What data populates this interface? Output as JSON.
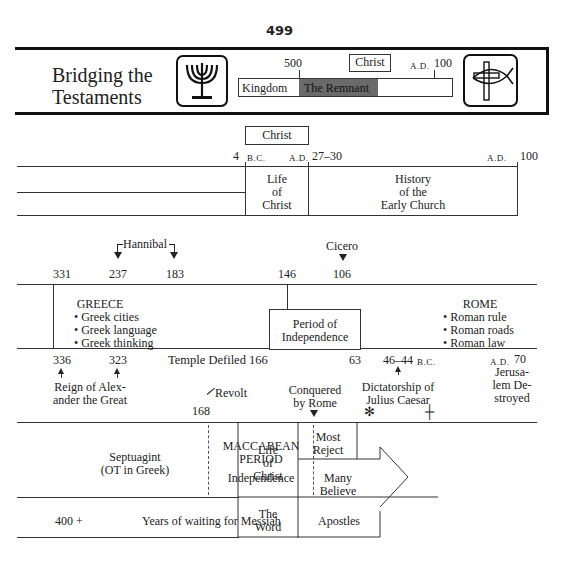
{
  "page_number": "499",
  "header": {
    "title_line1": "Bridging the",
    "title_line2": "Testaments",
    "mini_timeline": {
      "tick_500": "500",
      "christ_label": "Christ",
      "ad_prefix": "A.D.",
      "ad_100": "100",
      "kingdom": "Kingdom",
      "remnant": "The Remnant"
    },
    "left_icon": "menorah-icon",
    "right_icon": "cross-fish-icon"
  },
  "section1": {
    "christ_label": "Christ",
    "date_4bc_num": "4",
    "date_4bc_suffix": "B.C.",
    "date_ad_prefix": "A.D.",
    "date_27_30": "27–30",
    "date_ad100_prefix": "A.D.",
    "date_ad100": "100",
    "life_of_christ": [
      "Life",
      "of",
      "Christ"
    ],
    "early_church": [
      "History",
      "of the",
      "Early Church"
    ]
  },
  "section2": {
    "hannibal": "Hannibal",
    "cicero": "Cicero",
    "top_dates": [
      "331",
      "237",
      "183",
      "146",
      "106"
    ],
    "greece": {
      "title": "GREECE",
      "items": [
        "Greek cities",
        "Greek language",
        "Greek thinking"
      ]
    },
    "independence_box": [
      "Period of",
      "Independence"
    ],
    "rome": {
      "title": "ROME",
      "items": [
        "Roman rule",
        "Roman roads",
        "Roman law"
      ]
    },
    "bottom_dates": {
      "d336": "336",
      "d323": "323",
      "temple": "Temple Defiled 166",
      "d63": "63",
      "d46_44": "46–44",
      "bc": "B.C.",
      "ad": "A.D.",
      "d70": "70"
    },
    "alexander": [
      "Reign of Alex-",
      "ander the Great"
    ],
    "revolt": "Revolt",
    "d168": "168",
    "conquered": [
      "Conquered",
      "by Rome"
    ],
    "caesar": [
      "Dictatorship of",
      "Julius Caesar"
    ],
    "jerusalem": [
      "Jerusa-",
      "lem De-",
      "stroyed"
    ]
  },
  "section3": {
    "septuagint": [
      "Septuagint",
      "(OT in Greek)"
    ],
    "maccabean": [
      "MACCABEAN",
      "PERIOD"
    ],
    "independence": "Independence",
    "life_of_christ": [
      "Life",
      "of",
      "Christ"
    ],
    "most_reject": [
      "Most",
      "Reject"
    ],
    "many_believe": [
      "Many",
      "Believe"
    ],
    "years_num": "400 +",
    "years_text": "Years of waiting for Messiah",
    "the_word": [
      "The",
      "Word"
    ],
    "apostles": "Apostles"
  }
}
